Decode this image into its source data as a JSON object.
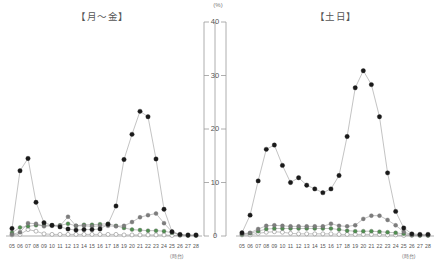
{
  "figure": {
    "y_unit_label": "(%)",
    "x_unit_label": "(時台)"
  },
  "panels": {
    "left": {
      "title": "【月～金】"
    },
    "right": {
      "title": "【土日】"
    }
  },
  "axis": {
    "y_ticks": [
      "0",
      "10",
      "20",
      "30",
      "40"
    ],
    "y_tick_values": [
      0,
      10,
      20,
      30,
      40
    ],
    "x_ticks": [
      "05",
      "06",
      "07",
      "08",
      "09",
      "10",
      "11",
      "12",
      "13",
      "14",
      "15",
      "16",
      "17",
      "18",
      "19",
      "20",
      "21",
      "22",
      "23",
      "24",
      "25",
      "26",
      "27",
      "28"
    ]
  },
  "colors": {
    "black": "#1a1a1a",
    "gray": "#7d7d7d",
    "green": "#4f8f4f",
    "open": "#ffffff",
    "line": "#9a9a9a",
    "axis": "#9a9a9a",
    "text": "#555555"
  },
  "chart_data": {
    "type": "line",
    "title": "",
    "xlabel": "(時台)",
    "ylabel": "(%)",
    "ylim": [
      0,
      40
    ],
    "grid": false,
    "legend": "none",
    "x": [
      "05",
      "06",
      "07",
      "08",
      "09",
      "10",
      "11",
      "12",
      "13",
      "14",
      "15",
      "16",
      "17",
      "18",
      "19",
      "20",
      "21",
      "22",
      "23",
      "24",
      "25",
      "26",
      "27",
      "28"
    ],
    "panels": [
      {
        "name": "【月～金】",
        "series": [
          {
            "name": "black-filled",
            "marker": "filled-circle",
            "color": "#1a1a1a",
            "values": [
              1.4,
              12.2,
              14.5,
              6.3,
              2.5,
              2.0,
              1.7,
              1.3,
              1.1,
              1.2,
              1.2,
              1.3,
              2.2,
              5.6,
              14.3,
              19.0,
              23.3,
              22.3,
              14.4,
              5.0,
              0.8,
              0.3,
              0.2,
              0.2
            ]
          },
          {
            "name": "gray-filled",
            "marker": "half-filled-circle",
            "color": "#7d7d7d",
            "values": [
              0.3,
              0.7,
              2.4,
              2.3,
              1.8,
              1.9,
              1.9,
              3.6,
              1.9,
              1.9,
              1.8,
              1.9,
              1.9,
              1.8,
              1.9,
              2.6,
              3.5,
              3.9,
              4.2,
              2.4,
              0.8,
              0.2,
              0.1,
              0.1
            ]
          },
          {
            "name": "green-filled",
            "marker": "circle",
            "color": "#4f8f4f",
            "values": [
              0.6,
              1.6,
              1.8,
              2.0,
              2.0,
              2.0,
              2.0,
              2.3,
              1.9,
              2.1,
              2.1,
              2.2,
              2.3,
              1.9,
              1.5,
              1.2,
              1.1,
              1.0,
              1.0,
              0.9,
              0.6,
              0.2,
              0.1,
              0.1
            ]
          },
          {
            "name": "open-circle",
            "marker": "open-circle",
            "color": "#ffffff",
            "values": [
              0.2,
              0.3,
              1.2,
              0.9,
              0.4,
              0.3,
              0.3,
              0.3,
              0.3,
              0.3,
              0.3,
              0.3,
              0.3,
              0.3,
              0.2,
              0.2,
              0.2,
              0.2,
              0.2,
              0.2,
              0.1,
              0.1,
              0.1,
              0.1
            ]
          }
        ]
      },
      {
        "name": "【土日】",
        "series": [
          {
            "name": "black-filled",
            "marker": "filled-circle",
            "color": "#1a1a1a",
            "values": [
              0.6,
              3.9,
              10.3,
              16.2,
              17.0,
              13.2,
              10.0,
              10.9,
              9.5,
              8.8,
              8.1,
              8.8,
              11.3,
              18.6,
              27.7,
              30.9,
              28.3,
              22.3,
              11.8,
              4.6,
              1.5,
              0.4,
              0.3,
              0.3
            ]
          },
          {
            "name": "gray-filled",
            "marker": "half-filled-circle",
            "color": "#7d7d7d",
            "values": [
              0.4,
              0.6,
              1.3,
              1.9,
              2.0,
              1.9,
              1.8,
              1.8,
              1.8,
              1.8,
              1.8,
              2.3,
              1.9,
              1.8,
              2.0,
              3.2,
              3.8,
              3.8,
              3.0,
              2.0,
              0.8,
              0.2,
              0.2,
              0.2
            ]
          },
          {
            "name": "green-filled",
            "marker": "circle",
            "color": "#4f8f4f",
            "values": [
              0.3,
              0.5,
              0.9,
              1.3,
              1.4,
              1.4,
              1.4,
              1.4,
              1.4,
              1.4,
              1.4,
              1.4,
              1.2,
              1.0,
              0.9,
              0.9,
              0.9,
              0.8,
              0.7,
              0.6,
              0.4,
              0.2,
              0.1,
              0.1
            ]
          },
          {
            "name": "open-circle",
            "marker": "open-circle",
            "color": "#ffffff",
            "values": [
              0.2,
              0.2,
              0.5,
              0.7,
              0.8,
              0.7,
              0.5,
              0.4,
              0.4,
              0.4,
              0.4,
              0.4,
              0.3,
              0.3,
              0.3,
              0.3,
              0.3,
              0.3,
              0.2,
              0.2,
              0.1,
              0.1,
              0.1,
              0.1
            ]
          }
        ]
      }
    ]
  }
}
